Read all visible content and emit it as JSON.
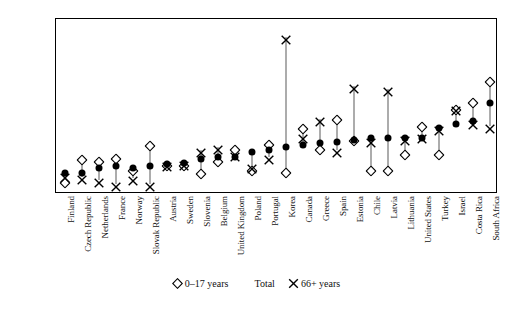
{
  "chart_data": {
    "type": "scatter",
    "title": "",
    "subtitle": "",
    "xlabel": "",
    "ylabel": "",
    "ylim": [
      0.0,
      0.5
    ],
    "ytick_labels": [
      "0.00",
      "0.05",
      "0.10",
      "0.15",
      "0.20",
      "0.25",
      "0.30",
      "0.35",
      "0.40",
      "0.45",
      "0.50"
    ],
    "ytick_values": [
      0.0,
      0.05,
      0.1,
      0.15,
      0.2,
      0.25,
      0.3,
      0.35,
      0.4,
      0.45,
      0.5
    ],
    "grid": false,
    "legend_position": "bottom",
    "categories": [
      "Finland",
      "Czech Republic",
      "Netherlands",
      "France",
      "Norway",
      "Slovak Republic",
      "Austria",
      "Sweden",
      "Slovenia",
      "Belgium",
      "United Kingdom",
      "Poland",
      "Portugal",
      "Korea",
      "Canada",
      "Greece",
      "Spain",
      "Estonia",
      "Chile",
      "Latvia",
      "Lithuania",
      "United States",
      "Turkey",
      "Israel",
      "Costa Rica",
      "South Africa"
    ],
    "series": [
      {
        "name": "0–17 years",
        "marker": "diamond-open",
        "values": [
          0.04,
          0.105,
          0.1,
          0.11,
          0.075,
          0.145,
          0.09,
          0.09,
          0.065,
          0.1,
          0.135,
          0.075,
          0.15,
          0.07,
          0.195,
          0.135,
          0.22,
          0.16,
          0.075,
          0.075,
          0.12,
          0.2,
          0.12,
          0.25,
          0.27,
          0.33
        ]
      },
      {
        "name": "Total",
        "marker": "circle-filled",
        "values": [
          0.06,
          0.06,
          0.075,
          0.08,
          0.075,
          0.08,
          0.085,
          0.09,
          0.1,
          0.105,
          0.105,
          0.12,
          0.125,
          0.135,
          0.14,
          0.145,
          0.15,
          0.155,
          0.16,
          0.16,
          0.16,
          0.16,
          0.19,
          0.2,
          0.21,
          0.26
        ]
      },
      {
        "name": "66+ years",
        "marker": "x-cross",
        "values": [
          0.055,
          0.05,
          0.04,
          0.03,
          0.045,
          0.03,
          0.085,
          0.09,
          0.125,
          0.135,
          0.115,
          0.08,
          0.105,
          0.45,
          0.165,
          0.215,
          0.125,
          0.31,
          0.155,
          0.3,
          0.16,
          0.165,
          0.19,
          0.245,
          0.205,
          0.195
        ]
      }
    ],
    "legend": [
      {
        "label": "0–17 years",
        "marker": "diamond-open"
      },
      {
        "label": "Total",
        "marker": "circle-filled"
      },
      {
        "label": "66+ years",
        "marker": "x-cross"
      }
    ],
    "colors": {
      "marker_fill": "#000000",
      "marker_stroke": "#000000",
      "connector": "#5a5a5a",
      "axis": "#000000",
      "background": "#ffffff"
    }
  }
}
